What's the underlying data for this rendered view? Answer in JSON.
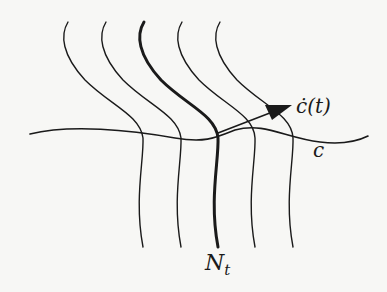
{
  "figure": {
    "type": "foliation-diagram",
    "labels": {
      "velocity": "ċ(t)",
      "curve": "c",
      "leaf": "N",
      "leaf_sub": "t"
    },
    "colors": {
      "ink": "#1a1a1a",
      "background": "#f7f7f5"
    },
    "leaves": 5,
    "highlighted_leaf_index": 2
  }
}
